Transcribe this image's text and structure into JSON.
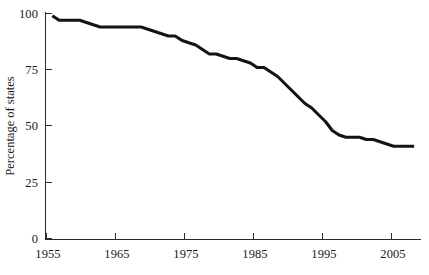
{
  "chart_data": {
    "type": "line",
    "title": "",
    "subtitle": "",
    "xlabel": "",
    "ylabel": "Percentage of states",
    "xlim": [
      1954,
      2009
    ],
    "ylim": [
      0,
      100
    ],
    "grid": false,
    "legend": null,
    "annotations": [],
    "x_ticks": [
      1955,
      1965,
      1975,
      1985,
      1995,
      2005
    ],
    "x_tick_labels": [
      "1955",
      "1965",
      "1975",
      "1985",
      "1995",
      "2005"
    ],
    "y_ticks": [
      0,
      25,
      50,
      75,
      100
    ],
    "y_tick_labels": [
      "0",
      "25",
      "50",
      "75",
      "100"
    ],
    "series": [
      {
        "name": "Percentage of states",
        "color": "#141414",
        "x": [
          1955,
          1956,
          1957,
          1958,
          1959,
          1960,
          1961,
          1962,
          1963,
          1964,
          1965,
          1966,
          1967,
          1968,
          1969,
          1970,
          1971,
          1972,
          1973,
          1974,
          1975,
          1976,
          1977,
          1978,
          1979,
          1980,
          1981,
          1982,
          1983,
          1984,
          1985,
          1986,
          1987,
          1988,
          1989,
          1990,
          1991,
          1992,
          1993,
          1994,
          1995,
          1996,
          1997,
          1998,
          1999,
          2000,
          2001,
          2002,
          2003,
          2004,
          2005,
          2006,
          2007,
          2008
        ],
        "values": [
          99,
          97,
          97,
          97,
          97,
          96,
          95,
          94,
          94,
          94,
          94,
          94,
          94,
          94,
          93,
          92,
          91,
          90,
          90,
          88,
          87,
          86,
          84,
          82,
          82,
          81,
          80,
          80,
          79,
          78,
          76,
          76,
          74,
          72,
          69,
          66,
          63,
          60,
          58,
          55,
          52,
          48,
          46,
          45,
          45,
          45,
          44,
          44,
          43,
          42,
          41,
          41,
          41,
          41
        ]
      }
    ]
  }
}
